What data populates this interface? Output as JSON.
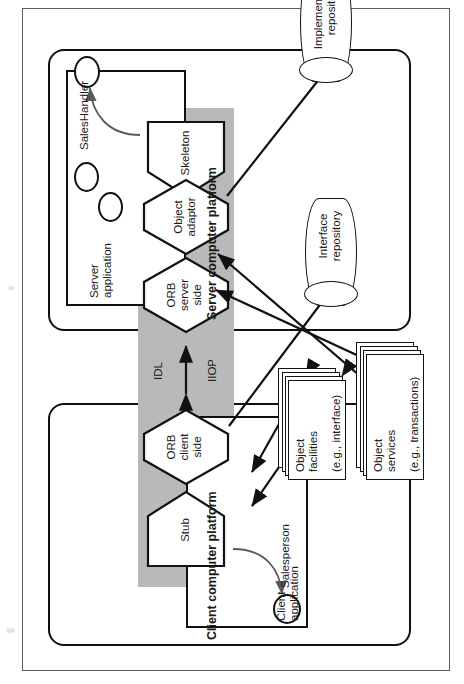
{
  "figure": {
    "kind": "corba-architecture-diagram",
    "orientation": "rotated-90-ccw",
    "colors": {
      "band_grey": "#b9b9b9",
      "outline": "#111111",
      "page_border": "#5d5d5d",
      "thin_arrow": "#5a5a5a"
    }
  },
  "platforms": {
    "server": {
      "label": "Server computer platform"
    },
    "client": {
      "label": "Client computer platform"
    }
  },
  "applications": {
    "server": {
      "label": "Server\napplication"
    },
    "client": {
      "label": "Client\napplication"
    }
  },
  "actors": {
    "sales_handler": {
      "label": "SalesHandler"
    },
    "salesperson": {
      "label": "Salesperson"
    }
  },
  "middleware": {
    "skeleton": {
      "label": "Skeleton"
    },
    "object_adaptor": {
      "label": "Object\nadaptor"
    },
    "orb_server": {
      "label": "ORB\nserver\nside"
    },
    "orb_client": {
      "label": "ORB\nclient\nside"
    },
    "stub": {
      "label": "Stub"
    }
  },
  "band_labels": {
    "idl": "IDL",
    "iiop": "IIOP"
  },
  "repositories": [
    {
      "label": "Implementation\nrepository"
    },
    {
      "label": "Interface\nrepository"
    }
  ],
  "service_stacks": [
    {
      "title": "Object\nfacilities",
      "subtitle": "(e.g., interface)"
    },
    {
      "title": "Object\nservices",
      "subtitle": "(e.g., transactions)"
    }
  ]
}
